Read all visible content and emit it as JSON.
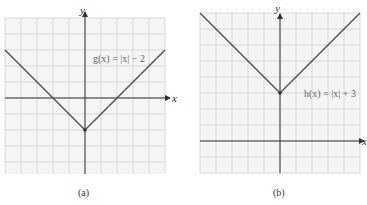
{
  "chart_data": [
    {
      "type": "line",
      "panel_label": "(a)",
      "function_label": "g(x) = |x| − 2",
      "xlabel": "x",
      "ylabel": "y",
      "grid": true,
      "xlim": [
        -5,
        5
      ],
      "ylim": [
        -5,
        5
      ],
      "x": [
        -5,
        0,
        5
      ],
      "values": [
        3,
        -2,
        3
      ],
      "vertex": [
        0,
        -2
      ],
      "x_intercepts": [
        -2,
        2
      ]
    },
    {
      "type": "line",
      "panel_label": "(b)",
      "function_label": "h(x) = |x| + 3",
      "xlabel": "x",
      "ylabel": "y",
      "grid": true,
      "xlim": [
        -5,
        5
      ],
      "ylim": [
        -2,
        8
      ],
      "x": [
        -5,
        0,
        5
      ],
      "values": [
        8,
        3,
        8
      ],
      "vertex": [
        0,
        3
      ]
    }
  ],
  "panels": {
    "a": {
      "caption": "(a)",
      "fn": "g(x) = |x| − 2",
      "xlabel": "x",
      "ylabel": "y"
    },
    "b": {
      "caption": "(b)",
      "fn": "h(x) = |x| + 3",
      "xlabel": "x",
      "ylabel": "y"
    }
  },
  "colors": {
    "grid": "#d0d0d0",
    "axis": "#333333",
    "curve": "#555555",
    "grid_bg": "#f4f4f4"
  }
}
